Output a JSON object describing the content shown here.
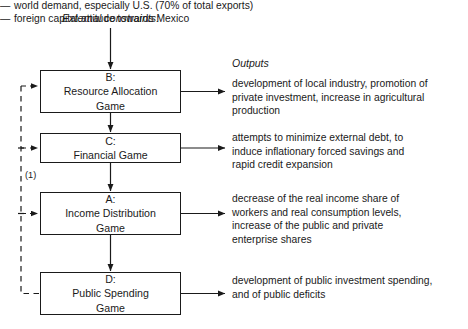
{
  "diagram": {
    "external_constraints_label": "External constraints:",
    "constraints": [
      {
        "dash": "—",
        "text": "world demand, especially U.S. (70% of total exports)"
      },
      {
        "dash": "—",
        "text": "foreign capital attitude towards Mexico"
      }
    ],
    "outputs_heading": "Outputs",
    "feedback_note": "(1)",
    "boxes": [
      {
        "code": "B:",
        "title": "Resource Allocation\nGame",
        "output": "development of local industry, promotion of\nprivate investment, increase in agricultural\nproduction"
      },
      {
        "code": "C:",
        "title": "Financial Game",
        "output": "attempts to minimize external debt, to\ninduce inflationary forced savings and\nrapid credit expansion"
      },
      {
        "code": "A:",
        "title": "Income Distribution\nGame",
        "output": "decrease of the real income share of\nworkers and real consumption levels,\nincrease of the public and private\nenterprise shares"
      },
      {
        "code": "D:",
        "title": "Public Spending\nGame",
        "output": "development of public investment spending,\nand of public deficits"
      }
    ],
    "colors": {
      "ink": "#1a1a1a",
      "background": "#ffffff"
    }
  }
}
